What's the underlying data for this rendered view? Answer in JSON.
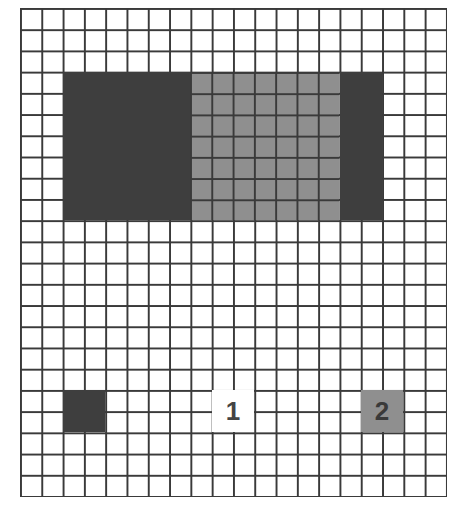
{
  "grid": {
    "columns": 20,
    "rows": 23,
    "line_color": "#3a3a3a",
    "cell_color": "#ffffff"
  },
  "regions": [
    {
      "id": "big-dark-block",
      "shade": "dark",
      "col": 2,
      "row": 3,
      "col_span": 6,
      "row_span": 7,
      "color": "#3e3e3e",
      "label": ""
    },
    {
      "id": "big-gray-block",
      "shade": "gray",
      "col": 8,
      "row": 3,
      "col_span": 7,
      "row_span": 7,
      "color": "#8f8f8f",
      "label": ""
    },
    {
      "id": "right-dark-strip",
      "shade": "dark",
      "col": 15,
      "row": 3,
      "col_span": 2,
      "row_span": 7,
      "color": "#3e3e3e",
      "label": ""
    },
    {
      "id": "small-dark-square",
      "shade": "dark",
      "col": 2,
      "row": 18,
      "col_span": 2,
      "row_span": 2,
      "color": "#3e3e3e",
      "label": ""
    },
    {
      "id": "label-box-1",
      "shade": "plain",
      "col": 9,
      "row": 18,
      "col_span": 2,
      "row_span": 2,
      "color": "#ffffff",
      "label": "1"
    },
    {
      "id": "small-gray-square-2",
      "shade": "gray-solid",
      "col": 16,
      "row": 18,
      "col_span": 2,
      "row_span": 2,
      "color": "#8f8f8f",
      "label": "2"
    }
  ],
  "labels": {
    "one": "1",
    "two": "2"
  },
  "colors": {
    "dark": "#3e3e3e",
    "gray": "#8f8f8f",
    "label_one_text": "#444444",
    "label_two_text": "#3a3a3a"
  }
}
